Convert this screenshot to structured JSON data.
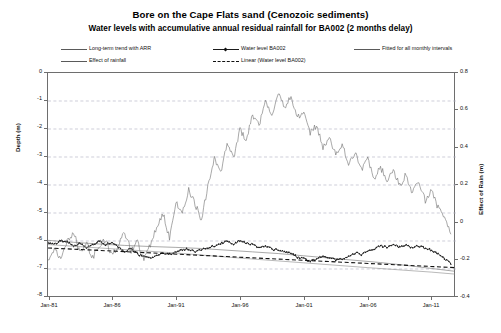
{
  "chart_data": {
    "type": "line",
    "title": "Bore on the Cape Flats sand (Cenozoic sediments)",
    "subtitle": "Water levels with accumulative annual residual rainfall for BA002 (2 months delay)",
    "xlabel": "",
    "ylabel": "Depth (m)",
    "y2label": "Effect of Rain (m)",
    "grid": true,
    "legend_position": "top",
    "xlim": [
      "Jan-81",
      "Jan-13"
    ],
    "ylim": [
      -8,
      0
    ],
    "y2lim": [
      -0.4,
      0.8
    ],
    "xticks": [
      "Jan-81",
      "Jan-86",
      "Jan-91",
      "Jan-96",
      "Jan-01",
      "Jan-06",
      "Jan-11"
    ],
    "yticks": [
      "0",
      "-1",
      "-2",
      "-3",
      "-4",
      "-5",
      "-6",
      "-7",
      "-8"
    ],
    "y2ticks": [
      "0.8",
      "0.6",
      "0.4",
      "0.2",
      "0",
      "-0.2",
      "-0.4"
    ],
    "series": [
      {
        "name": "Long-term trend with ARR",
        "axis": "left",
        "style": "solid-thin",
        "color": "#6e6e6e",
        "x": [
          1981.0,
          1983.0,
          1985.0,
          1987.0,
          1989.0,
          1991.0,
          1993.0,
          1995.0,
          1997.0,
          1999.0,
          2001.0,
          2003.0,
          2005.0,
          2007.0,
          2009.0,
          2011.0,
          2012.8
        ],
        "values": [
          -5.95,
          -6.02,
          -6.08,
          -6.13,
          -6.17,
          -6.2,
          -6.24,
          -6.3,
          -6.36,
          -6.42,
          -6.5,
          -6.58,
          -6.66,
          -6.74,
          -6.84,
          -6.95,
          -7.05
        ]
      },
      {
        "name": "Water level BA002",
        "axis": "left",
        "style": "solid-thick-marker",
        "color": "#1c1c1c",
        "x": [
          1981.0,
          1981.5,
          1982.0,
          1982.5,
          1983.0,
          1983.5,
          1984.0,
          1984.5,
          1985.0,
          1985.5,
          1986.0,
          1986.5,
          1987.0,
          1987.5,
          1988.0,
          1988.5,
          1989.0,
          1989.5,
          1990.0,
          1990.5,
          1991.0,
          1991.5,
          1992.0,
          1992.5,
          1993.0,
          1993.5,
          1994.0,
          1994.5,
          1995.0,
          1995.5,
          1996.0,
          1996.5,
          1997.0,
          1997.5,
          1998.0,
          1998.5,
          1999.0,
          1999.5,
          2000.0,
          2000.5,
          2001.0,
          2001.5,
          2002.0,
          2002.5,
          2003.0,
          2003.5,
          2004.0,
          2004.5,
          2005.0,
          2005.5,
          2006.0,
          2006.5,
          2007.0,
          2007.5,
          2008.0,
          2008.5,
          2009.0,
          2009.5,
          2010.0,
          2010.5,
          2011.0,
          2011.5,
          2012.0,
          2012.5
        ],
        "values": [
          -6.05,
          -6.1,
          -5.95,
          -6.0,
          -6.15,
          -6.05,
          -6.2,
          -6.12,
          -5.95,
          -6.1,
          -6.0,
          -6.2,
          -6.35,
          -6.25,
          -6.45,
          -6.5,
          -6.6,
          -6.5,
          -6.4,
          -6.45,
          -6.35,
          -6.3,
          -6.25,
          -6.35,
          -6.3,
          -6.2,
          -6.15,
          -6.05,
          -6.0,
          -6.1,
          -5.95,
          -6.05,
          -6.1,
          -6.2,
          -6.15,
          -6.25,
          -6.3,
          -6.35,
          -6.4,
          -6.55,
          -6.6,
          -6.7,
          -6.6,
          -6.5,
          -6.55,
          -6.65,
          -6.6,
          -6.5,
          -6.4,
          -6.45,
          -6.35,
          -6.25,
          -6.15,
          -6.2,
          -6.1,
          -6.2,
          -6.12,
          -6.2,
          -6.15,
          -6.25,
          -6.3,
          -6.45,
          -6.6,
          -6.8
        ]
      },
      {
        "name": "Fitted for all monthly intervals",
        "axis": "left",
        "style": "solid-thin",
        "color": "#8a8a8a",
        "x": [
          1981.0,
          1986.0,
          1991.0,
          1996.0,
          2001.0,
          2006.0,
          2011.0,
          2012.8
        ],
        "values": [
          -6.1,
          -6.25,
          -6.4,
          -6.58,
          -6.75,
          -6.92,
          -7.08,
          -7.15
        ]
      },
      {
        "name": "Effect of rainfall",
        "axis": "right",
        "style": "solid-thin",
        "color": "#6e6e6e",
        "x": [
          1981.0,
          1981.5,
          1982.0,
          1982.5,
          1983.0,
          1983.5,
          1984.0,
          1984.5,
          1985.0,
          1985.5,
          1986.0,
          1986.5,
          1987.0,
          1987.5,
          1988.0,
          1988.5,
          1989.0,
          1989.5,
          1990.0,
          1990.5,
          1991.0,
          1991.5,
          1992.0,
          1992.5,
          1993.0,
          1993.5,
          1994.0,
          1994.5,
          1995.0,
          1995.5,
          1996.0,
          1996.5,
          1997.0,
          1997.5,
          1998.0,
          1998.5,
          1999.0,
          1999.5,
          2000.0,
          2000.5,
          2001.0,
          2001.5,
          2002.0,
          2002.5,
          2003.0,
          2003.5,
          2004.0,
          2004.5,
          2005.0,
          2005.5,
          2006.0,
          2006.5,
          2007.0,
          2007.5,
          2008.0,
          2008.5,
          2009.0,
          2009.5,
          2010.0,
          2010.5,
          2011.0,
          2011.5,
          2012.0,
          2012.5
        ],
        "values": [
          -0.21,
          -0.14,
          -0.19,
          -0.1,
          -0.05,
          -0.16,
          -0.11,
          -0.18,
          -0.13,
          -0.09,
          -0.17,
          -0.12,
          -0.05,
          -0.15,
          -0.1,
          -0.2,
          -0.12,
          -0.02,
          0.05,
          -0.08,
          0.12,
          0.05,
          0.18,
          0.1,
          0.02,
          0.2,
          0.35,
          0.26,
          0.42,
          0.34,
          0.5,
          0.44,
          0.58,
          0.52,
          0.66,
          0.58,
          0.7,
          0.62,
          0.68,
          0.56,
          0.6,
          0.48,
          0.52,
          0.4,
          0.46,
          0.36,
          0.42,
          0.32,
          0.38,
          0.28,
          0.34,
          0.24,
          0.3,
          0.22,
          0.28,
          0.2,
          0.26,
          0.16,
          0.22,
          0.12,
          0.18,
          0.08,
          0.02,
          -0.06
        ]
      },
      {
        "name": "Linear (Water level BA002)",
        "axis": "left",
        "style": "dashed",
        "color": "#111111",
        "x": [
          1981.0,
          2012.8
        ],
        "values": [
          -6.22,
          -6.92
        ]
      }
    ],
    "legend_entries": [
      {
        "label": "Long-term trend with ARR",
        "style": "solid-thin"
      },
      {
        "label": "Water level BA002",
        "style": "solid-marker"
      },
      {
        "label": "Fitted for all monthly intervals",
        "style": "solid-thin"
      },
      {
        "label": "Effect of rainfall",
        "style": "solid-thin"
      },
      {
        "label": "Linear (Water level BA002)",
        "style": "dashed"
      }
    ]
  },
  "axes": {
    "left_ticks": [
      "0",
      "-1",
      "-2",
      "-3",
      "-4",
      "-5",
      "-6",
      "-7",
      "-8"
    ],
    "right_ticks": [
      "0.8",
      "0.6",
      "0.4",
      "0.2",
      "0",
      "-0.2",
      "-0.4"
    ],
    "x_ticks": [
      "Jan-81",
      "Jan-86",
      "Jan-91",
      "Jan-96",
      "Jan-01",
      "Jan-06",
      "Jan-11"
    ],
    "left_title": "Depth (m)",
    "right_title": "Effect of Rain (m)"
  },
  "colors": {
    "frame": "#6e6e6e",
    "grid": "#b9b9c8",
    "thin_line": "#6e6e6e",
    "fitted_line": "#8a8a8a",
    "data_line": "#1c1c1c",
    "dashed_line": "#111111"
  }
}
